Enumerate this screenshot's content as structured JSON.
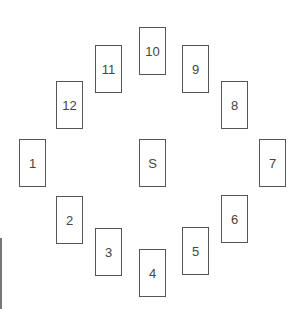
{
  "diagram": {
    "center": {
      "label": "S",
      "x": 139,
      "y": 139
    },
    "cards": [
      {
        "label": "1",
        "x": 19,
        "y": 139
      },
      {
        "label": "2",
        "x": 56,
        "y": 196
      },
      {
        "label": "3",
        "x": 95,
        "y": 228
      },
      {
        "label": "4",
        "x": 139,
        "y": 249
      },
      {
        "label": "5",
        "x": 182,
        "y": 227
      },
      {
        "label": "6",
        "x": 221,
        "y": 195
      },
      {
        "label": "7",
        "x": 259,
        "y": 139
      },
      {
        "label": "8",
        "x": 221,
        "y": 81
      },
      {
        "label": "9",
        "x": 182,
        "y": 45
      },
      {
        "label": "10",
        "x": 139,
        "y": 27
      },
      {
        "label": "11",
        "x": 95,
        "y": 45
      },
      {
        "label": "12",
        "x": 56,
        "y": 81
      }
    ],
    "colors": {
      "border": "#555555",
      "text": "#444444",
      "background": "#ffffff"
    }
  }
}
